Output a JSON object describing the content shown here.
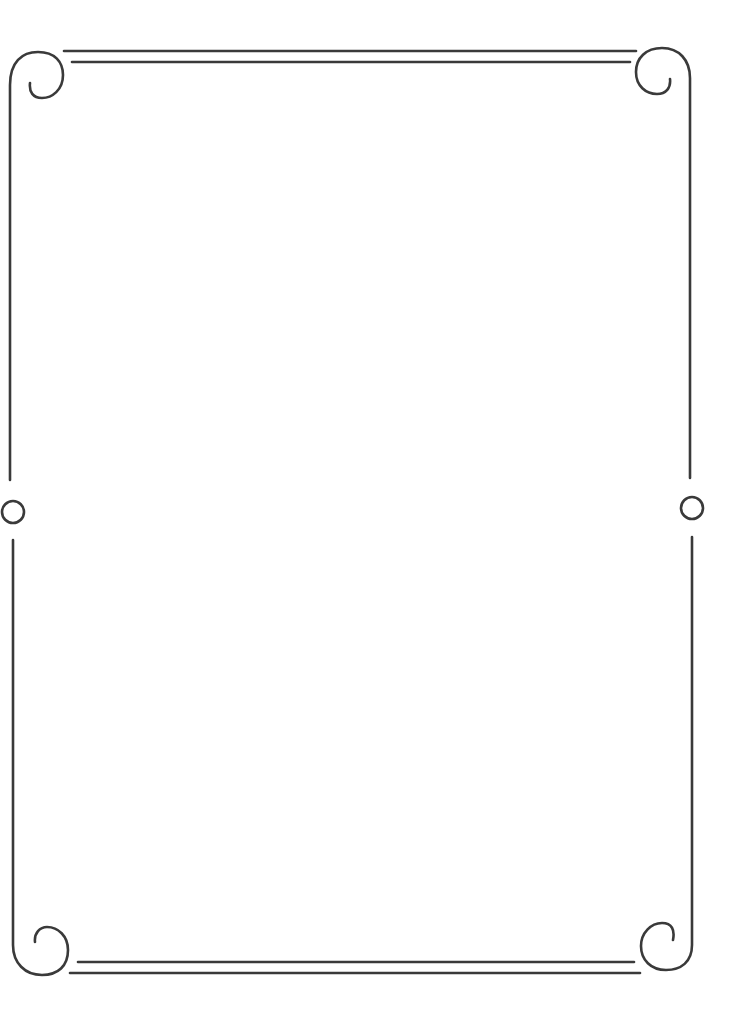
{
  "page": {
    "type": "decorative-border-frame",
    "stroke_color": "#3a3a3a",
    "background_color": "#ffffff"
  },
  "frame": {
    "corners": [
      "top-left-scroll-icon",
      "top-right-scroll-icon",
      "bottom-left-scroll-icon",
      "bottom-right-scroll-icon"
    ],
    "side_ornaments": [
      "left-ring-icon",
      "right-ring-icon"
    ],
    "content_text": ""
  }
}
